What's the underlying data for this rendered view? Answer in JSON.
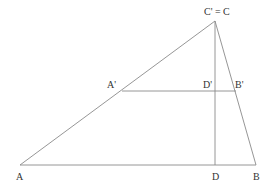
{
  "figure": {
    "kind": "geometry",
    "line_color": "#8a8a8a",
    "label_color": "#333333",
    "points": {
      "A": {
        "x": 20,
        "y": 165
      },
      "B": {
        "x": 256,
        "y": 165
      },
      "C": {
        "x": 215,
        "y": 21
      },
      "D": {
        "x": 215,
        "y": 165
      },
      "A1": {
        "x": 122,
        "y": 91
      },
      "B1": {
        "x": 236,
        "y": 91
      },
      "D1": {
        "x": 215,
        "y": 91
      }
    },
    "labels": {
      "A": "A",
      "B": "B",
      "C": "C' = C",
      "D": "D",
      "A1": "A'",
      "B1": "B'",
      "D1": "D'"
    },
    "segments": [
      {
        "name": "side-AB",
        "from": "A",
        "to": "B"
      },
      {
        "name": "side-AC",
        "from": "A",
        "to": "C"
      },
      {
        "name": "side-BC",
        "from": "B",
        "to": "C"
      },
      {
        "name": "altitude-CD",
        "from": "C",
        "to": "D"
      },
      {
        "name": "segment-A1B1",
        "from": "A1",
        "to": "B1"
      }
    ]
  }
}
